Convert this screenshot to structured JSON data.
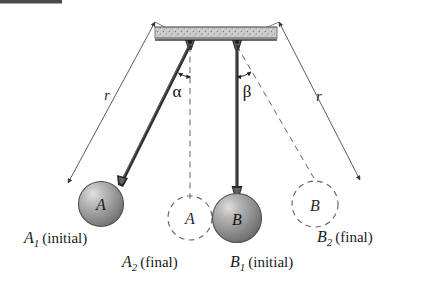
{
  "figure": {
    "name": "two-pendulum-collision-diagram",
    "background_color": "#ffffff",
    "width": 423,
    "height": 289
  },
  "top_artifact": {
    "label": "",
    "color": "#4a4a4a"
  },
  "ceiling": {
    "name": "support-ceiling-bar",
    "fill": "#c9c9c9",
    "edge_color": "#555555",
    "texture": "stipple-hatch"
  },
  "pivots": [
    {
      "id": "pivot-a",
      "label": ""
    },
    {
      "id": "pivot-b",
      "label": ""
    }
  ],
  "pendulums": [
    {
      "id": "pendulum-a",
      "ball_label": "A",
      "state": "initial",
      "rod_color": "#3a3a3a",
      "ball_fill": "#9a9a9a",
      "angle_symbol": "α",
      "radius_label": "r"
    },
    {
      "id": "pendulum-b",
      "ball_label": "B",
      "state": "initial",
      "rod_color": "#3a3a3a",
      "ball_fill": "#8f8f8f",
      "angle_symbol": "β",
      "radius_label": "r"
    }
  ],
  "ghost_positions": [
    {
      "id": "ghost-a",
      "ball_label": "A",
      "state": "final"
    },
    {
      "id": "ghost-b",
      "ball_label": "B",
      "state": "final"
    }
  ],
  "angles": {
    "alpha": "α",
    "beta": "β"
  },
  "radii": {
    "left": "r",
    "right": "r"
  },
  "captions": {
    "a1": {
      "var": "A",
      "sub": "1",
      "text": "(initial)"
    },
    "a2": {
      "var": "A",
      "sub": "2",
      "text": "(final)"
    },
    "b1": {
      "var": "B",
      "sub": "1",
      "text": "(initial)"
    },
    "b2": {
      "var": "B",
      "sub": "2",
      "text": "(final)"
    }
  }
}
